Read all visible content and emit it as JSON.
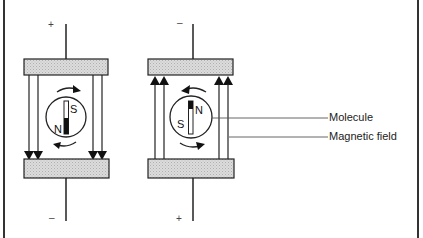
{
  "diagram": {
    "type": "molecule orientation in magnetic field between charged plates",
    "colors": {
      "line": "#222222",
      "plate_fill": "#d4d4d4",
      "background": "#ffffff"
    },
    "left_panel": {
      "top_sign": "+",
      "bottom_sign": "–",
      "field_direction": "down",
      "molecule_top_pole": "S",
      "molecule_bottom_pole": "N",
      "rotation": "clockwise"
    },
    "right_panel": {
      "top_sign": "–",
      "bottom_sign": "+",
      "field_direction": "up",
      "molecule_top_pole": "N",
      "molecule_side_label": "S",
      "rotation": "counterclockwise"
    },
    "labels": {
      "molecule": "Molecule",
      "magnetic_field": "Magnetic field"
    }
  }
}
